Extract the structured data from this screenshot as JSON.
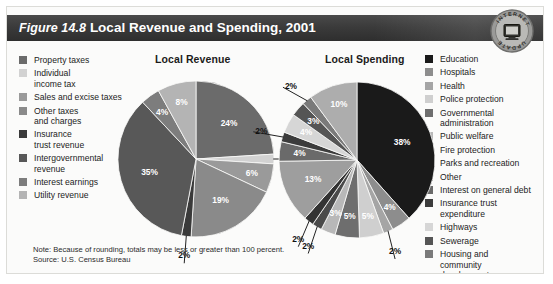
{
  "figure": {
    "number_label": "Figure 14.8",
    "title": "Local Revenue and Spending, 2001",
    "badge": {
      "top_text": "INTERNET",
      "bottom_text": "UPDATE",
      "icon": "computer-monitor-icon"
    },
    "note": "Note:  Because of rounding, totals may be less or greater than 100 percent.",
    "source": "Source:  U.S. Census Bureau"
  },
  "revenue_legend": {
    "items": [
      {
        "label": "Property taxes",
        "color": "#6b6b6b"
      },
      {
        "label": "Individual\nincome tax",
        "color": "#d2d2d2"
      },
      {
        "label": "Sales and excise taxes",
        "color": "#9a9a9a"
      },
      {
        "label": "Other taxes\nand charges",
        "color": "#8a8a8a"
      },
      {
        "label": "Insurance\ntrust revenue",
        "color": "#3a3a3a"
      },
      {
        "label": "Intergovernmental\nrevenue",
        "color": "#585858"
      },
      {
        "label": "Interest earnings",
        "color": "#7d7d7d"
      },
      {
        "label": "Utility revenue",
        "color": "#b4b4b4"
      }
    ]
  },
  "spending_legend": {
    "items": [
      {
        "label": "Education",
        "color": "#1a1a1a"
      },
      {
        "label": "Hospitals",
        "color": "#8d8d8d"
      },
      {
        "label": "Health",
        "color": "#a5a5a5"
      },
      {
        "label": "Police protection",
        "color": "#cfcfcf"
      },
      {
        "label": "Governmental\nadministration",
        "color": "#6e6e6e"
      },
      {
        "label": "Public welfare",
        "color": "#b8b8b8"
      },
      {
        "label": "Fire protection",
        "color": "#4a4a4a"
      },
      {
        "label": "Parks and recreation",
        "color": "#333333"
      },
      {
        "label": "Other",
        "color": "#9e9e9e"
      },
      {
        "label": "Interest on general debt",
        "color": "#6a6a6a"
      },
      {
        "label": "Insurance trust\nexpenditure",
        "color": "#3c3c3c"
      },
      {
        "label": "Highways",
        "color": "#d6d6d6"
      },
      {
        "label": "Sewerage",
        "color": "#555555"
      },
      {
        "label": "Housing and\ncommunity\ndevelopment",
        "color": "#7a7a7a"
      },
      {
        "label": "Utility",
        "color": "#adadad"
      }
    ]
  },
  "chart_data": [
    {
      "type": "pie",
      "title": "Local Revenue",
      "labels": [
        "Property taxes",
        "Individual income tax",
        "Sales and excise taxes",
        "Other taxes and charges",
        "Insurance trust revenue",
        "Intergovernmental revenue",
        "Interest earnings",
        "Utility revenue"
      ],
      "values": [
        24,
        2,
        6,
        19,
        2,
        35,
        4,
        8
      ],
      "value_labels": [
        "24%",
        "2%",
        "6%",
        "19%",
        "2%",
        "35%",
        "4%",
        "8%"
      ],
      "colors": [
        "#6b6b6b",
        "#d2d2d2",
        "#9a9a9a",
        "#8a8a8a",
        "#3a3a3a",
        "#585858",
        "#7d7d7d",
        "#b4b4b4"
      ],
      "legend_position": "left",
      "units": "percent"
    },
    {
      "type": "pie",
      "title": "Local Spending",
      "labels": [
        "Education",
        "Hospitals",
        "Health",
        "Police protection",
        "Governmental administration",
        "Public welfare",
        "Fire protection",
        "Parks and recreation",
        "Other",
        "Interest on general debt",
        "Insurance trust expenditure",
        "Highways",
        "Sewerage",
        "Housing and community development",
        "Utility"
      ],
      "values": [
        38,
        4,
        2,
        5,
        5,
        3,
        2,
        2,
        13,
        4,
        2,
        4,
        3,
        2,
        10
      ],
      "value_labels": [
        "38%",
        "4%",
        "2%",
        "5%",
        "5%",
        "3%",
        "2%",
        "2%",
        "13%",
        "4%",
        "2%",
        "4%",
        "3%",
        "2%",
        "10%"
      ],
      "colors": [
        "#1a1a1a",
        "#8d8d8d",
        "#a5a5a5",
        "#cfcfcf",
        "#6e6e6e",
        "#b8b8b8",
        "#4a4a4a",
        "#333333",
        "#9e9e9e",
        "#6a6a6a",
        "#3c3c3c",
        "#d6d6d6",
        "#555555",
        "#7a7a7a",
        "#adadad"
      ],
      "legend_position": "right",
      "units": "percent"
    }
  ]
}
